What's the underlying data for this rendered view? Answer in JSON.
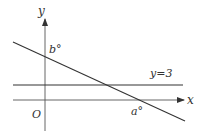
{
  "diagram": {
    "axes": {
      "x_label": "x",
      "y_label": "y",
      "origin_label": "O"
    },
    "lines": [
      {
        "name": "horizontal-line",
        "label": "y=3"
      },
      {
        "name": "decreasing-line",
        "y_intercept_label": "b°",
        "x_intercept_label": "a°"
      }
    ],
    "colors": {
      "line": "#333333",
      "axis": "#555555",
      "background": "#ffffff"
    }
  }
}
